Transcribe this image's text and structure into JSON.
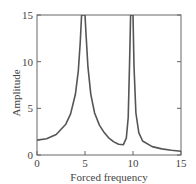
{
  "chart_data": {
    "type": "line",
    "title": "",
    "xlabel": "Forced frequency",
    "ylabel": "Amplitude",
    "xlim": [
      0,
      15
    ],
    "ylim": [
      0,
      15
    ],
    "xticks": [
      0,
      5,
      10,
      15
    ],
    "yticks": [
      0,
      5,
      10,
      15
    ],
    "xtick_labels": [
      "0",
      "5",
      "10",
      "15"
    ],
    "ytick_labels": [
      "0",
      "5",
      "10",
      "15"
    ],
    "grid": false,
    "legend": null,
    "series": [
      {
        "name": "Amplitude",
        "color": "#555555",
        "x": [
          0,
          1,
          2,
          3,
          3.5,
          4,
          4.3,
          4.5,
          4.65,
          4.75,
          5.0,
          5.1,
          5.3,
          5.6,
          6,
          6.5,
          7,
          7.5,
          8,
          8.5,
          9,
          9.3,
          9.5,
          9.65,
          9.75,
          10.0,
          10.1,
          10.3,
          10.6,
          11,
          12,
          13,
          14,
          15
        ],
        "values": [
          1.6,
          1.75,
          2.2,
          3.3,
          4.4,
          6.5,
          9.0,
          12.0,
          15,
          15,
          15,
          13.0,
          9.5,
          6.5,
          4.5,
          3.2,
          2.4,
          1.8,
          1.4,
          1.15,
          1.1,
          1.8,
          4.0,
          10.0,
          15,
          15,
          9.5,
          4.5,
          2.4,
          1.5,
          0.9,
          0.65,
          0.5,
          0.4
        ]
      }
    ]
  }
}
